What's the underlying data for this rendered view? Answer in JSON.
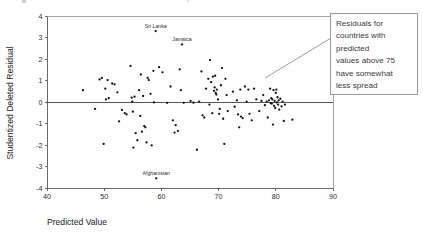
{
  "chart_data": {
    "type": "scatter",
    "title": "",
    "xlabel": "Predicted Value",
    "ylabel": "Studentized Deleted Residual",
    "xlim": [
      40,
      90
    ],
    "ylim": [
      -4,
      4
    ],
    "xticks": [
      40,
      50,
      60,
      70,
      80,
      90
    ],
    "yticks": [
      4,
      3,
      2,
      1,
      0,
      -1,
      -2,
      -3,
      -4
    ],
    "xtick_labels": [
      "40",
      "50",
      "60",
      "70",
      "80",
      "90"
    ],
    "ytick_labels": [
      "4",
      "3",
      "2",
      "1",
      "0",
      "-1",
      "-2",
      "-3",
      "-4"
    ],
    "grid": false,
    "legend": "none",
    "reference_line_y": 0,
    "series": [
      {
        "name": "countries",
        "points": [
          [
            46.3,
            0.55
          ],
          [
            48.4,
            -0.32
          ],
          [
            49.2,
            1.05
          ],
          [
            49.6,
            1.12
          ],
          [
            49.9,
            -1.95
          ],
          [
            50.2,
            0.62
          ],
          [
            50.3,
            0.12
          ],
          [
            50.6,
            1.02
          ],
          [
            50.8,
            0.18
          ],
          [
            51.4,
            0.86
          ],
          [
            51.8,
            0.82
          ],
          [
            52.3,
            0.45
          ],
          [
            52.6,
            -0.9
          ],
          [
            53.1,
            -0.37
          ],
          [
            53.6,
            -0.52
          ],
          [
            53.9,
            -0.58
          ],
          [
            54.6,
            1.68
          ],
          [
            54.8,
            0.2
          ],
          [
            54.9,
            0.02
          ],
          [
            55.0,
            -0.45
          ],
          [
            55.1,
            -2.12
          ],
          [
            55.3,
            0.25
          ],
          [
            55.5,
            -1.45
          ],
          [
            55.8,
            -1.78
          ],
          [
            56.1,
            0.55
          ],
          [
            56.3,
            -0.65
          ],
          [
            56.4,
            1.28
          ],
          [
            56.6,
            -1.38
          ],
          [
            56.8,
            0.28
          ],
          [
            57.0,
            -1.12
          ],
          [
            57.2,
            -1.18
          ],
          [
            57.4,
            -1.88
          ],
          [
            57.6,
            1.12
          ],
          [
            57.8,
            1.02
          ],
          [
            58.1,
            0.38
          ],
          [
            58.3,
            -2.02
          ],
          [
            58.6,
            1.45
          ],
          [
            58.7,
            -0.02
          ],
          [
            59.0,
            3.3
          ],
          [
            59.1,
            -3.55
          ],
          [
            59.6,
            1.62
          ],
          [
            60.2,
            1.38
          ],
          [
            61.0,
            -0.04
          ],
          [
            61.6,
            0.72
          ],
          [
            62.0,
            -0.85
          ],
          [
            62.3,
            -1.42
          ],
          [
            62.5,
            -1.08
          ],
          [
            62.9,
            -1.35
          ],
          [
            63.2,
            1.52
          ],
          [
            63.4,
            0.55
          ],
          [
            63.6,
            2.68
          ],
          [
            63.9,
            -0.04
          ],
          [
            65.1,
            0.05
          ],
          [
            65.6,
            -0.03
          ],
          [
            66.2,
            -2.22
          ],
          [
            66.6,
            0.02
          ],
          [
            67.0,
            1.42
          ],
          [
            67.2,
            -0.62
          ],
          [
            67.5,
            -0.72
          ],
          [
            67.8,
            0.62
          ],
          [
            68.2,
            1.08
          ],
          [
            68.4,
            -0.12
          ],
          [
            68.5,
            1.95
          ],
          [
            68.7,
            0.92
          ],
          [
            68.9,
            -0.52
          ],
          [
            69.0,
            1.18
          ],
          [
            69.2,
            0.52
          ],
          [
            69.3,
            0.68
          ],
          [
            69.4,
            1.22
          ],
          [
            69.5,
            0.42
          ],
          [
            69.6,
            0.35
          ],
          [
            69.7,
            0.58
          ],
          [
            69.9,
            0.12
          ],
          [
            70.1,
            -0.55
          ],
          [
            70.2,
            -0.32
          ],
          [
            70.4,
            0.78
          ],
          [
            70.6,
            1.58
          ],
          [
            70.8,
            -0.78
          ],
          [
            71.0,
            -1.95
          ],
          [
            71.2,
            1.08
          ],
          [
            71.4,
            0.32
          ],
          [
            71.6,
            -0.42
          ],
          [
            72.5,
            0.48
          ],
          [
            72.8,
            -0.22
          ],
          [
            73.2,
            0.08
          ],
          [
            73.4,
            -0.58
          ],
          [
            73.6,
            -1.18
          ],
          [
            73.8,
            0.58
          ],
          [
            73.9,
            -0.68
          ],
          [
            74.2,
            -0.75
          ],
          [
            74.6,
            0.72
          ],
          [
            74.9,
            0.02
          ],
          [
            75.2,
            0.58
          ],
          [
            75.4,
            -0.55
          ],
          [
            75.8,
            -0.85
          ],
          [
            76.2,
            0.62
          ],
          [
            76.6,
            0.12
          ],
          [
            77.1,
            -0.42
          ],
          [
            77.5,
            0.05
          ],
          [
            77.8,
            0.32
          ],
          [
            78.1,
            -0.15
          ],
          [
            78.4,
            0.02
          ],
          [
            78.6,
            -0.72
          ],
          [
            78.8,
            0.08
          ],
          [
            79.0,
            0.62
          ],
          [
            79.1,
            -0.05
          ],
          [
            79.2,
            0.18
          ],
          [
            79.3,
            -0.08
          ],
          [
            79.4,
            0.12
          ],
          [
            79.5,
            -1.05
          ],
          [
            79.6,
            0.55
          ],
          [
            79.7,
            -0.18
          ],
          [
            79.8,
            0.05
          ],
          [
            79.9,
            -0.28
          ],
          [
            80.0,
            0.42
          ],
          [
            80.1,
            0.58
          ],
          [
            80.2,
            -0.02
          ],
          [
            80.3,
            0.22
          ],
          [
            80.4,
            -0.12
          ],
          [
            80.5,
            0.08
          ],
          [
            80.6,
            -0.35
          ],
          [
            80.8,
            0.15
          ],
          [
            81.0,
            -0.2
          ],
          [
            81.2,
            0.02
          ],
          [
            81.4,
            -0.88
          ],
          [
            81.6,
            -0.12
          ],
          [
            82.9,
            -0.82
          ]
        ]
      }
    ],
    "annotations": [
      {
        "label": "Sri Lanka",
        "x": 59.0,
        "y": 3.3
      },
      {
        "label": "Jamaica",
        "x": 63.6,
        "y": 2.68
      },
      {
        "label": "Afghanistan",
        "x": 59.1,
        "y": -3.55
      }
    ]
  },
  "callout": {
    "lines": [
      "Residuals for",
      "countries with",
      "predicted",
      "values above 75",
      "have somewhat",
      "less spread"
    ]
  },
  "colors": {
    "point": "#111111",
    "axis": "#5a5a5a",
    "frame": "#8c8c8c",
    "callout_border": "#8f8f8f",
    "callout_text": "#3a3a3a",
    "background": "#ffffff"
  }
}
